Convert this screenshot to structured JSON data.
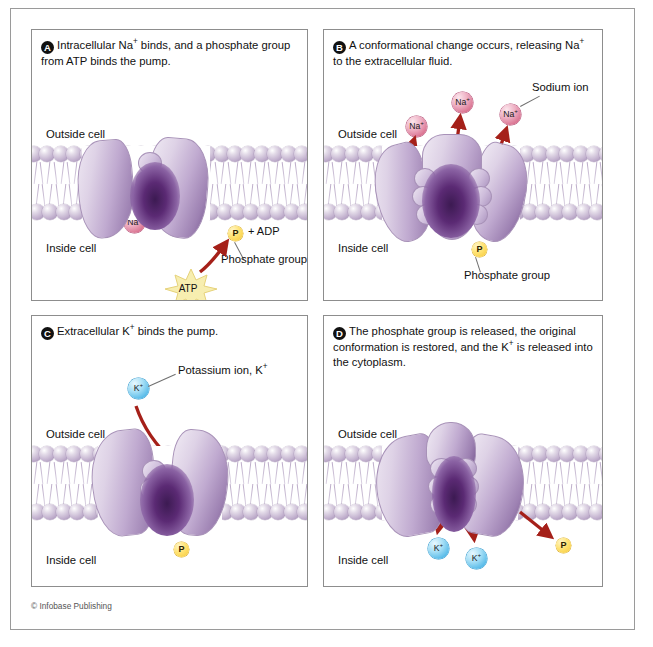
{
  "figure": {
    "credit": "© Infobase Publishing",
    "colors": {
      "sodium_ion": "#d9718f",
      "potassium_ion": "#54b9e8",
      "phosphate": "#ffe271",
      "membrane_head": "#c3b2cf",
      "pump_protein": "#c0aad0",
      "arrow": "#a52019",
      "atp_burst": "#f2e08a"
    }
  },
  "panels": [
    {
      "id": "A",
      "letter": "A",
      "caption_html": "Intracellular Na<sup>+</sup> binds, and a phosphate group from ATP binds the pump.",
      "outside_label": "Outside cell",
      "inside_label": "Inside cell",
      "ions": [
        {
          "type": "sodium",
          "label_html": "Na<sup>+</sup>"
        },
        {
          "type": "sodium",
          "label_html": "Na<sup>+</sup>"
        },
        {
          "type": "sodium",
          "label_html": "Na<sup>+</sup>"
        }
      ],
      "phosphate_label": "P",
      "adp_text": "+ ADP",
      "phosphate_annotation": "Phosphate group",
      "atp_label": "ATP"
    },
    {
      "id": "B",
      "letter": "B",
      "caption_html": "A conformational change occurs, releasing Na<sup>+</sup> to the extracellular fluid.",
      "outside_label": "Outside cell",
      "inside_label": "Inside cell",
      "ions": [
        {
          "type": "sodium",
          "label_html": "Na<sup>+</sup>"
        },
        {
          "type": "sodium",
          "label_html": "Na<sup>+</sup>"
        },
        {
          "type": "sodium",
          "label_html": "Na<sup>+</sup>"
        }
      ],
      "ion_annotation": "Sodium ion",
      "phosphate_label": "P",
      "phosphate_annotation": "Phosphate group"
    },
    {
      "id": "C",
      "letter": "C",
      "caption_html": "Extracellular K<sup>+</sup> binds the pump.",
      "outside_label": "Outside cell",
      "inside_label": "Inside cell",
      "ions": [
        {
          "type": "potassium",
          "label_html": "K<sup>+</sup>"
        },
        {
          "type": "potassium",
          "label_html": "K<sup>+</sup>"
        }
      ],
      "ion_annotation_html": "Potassium ion, K<sup>+</sup>",
      "phosphate_label": "P"
    },
    {
      "id": "D",
      "letter": "D",
      "caption_html": "The phosphate group is released, the original conformation is restored, and the K<sup>+</sup> is released into the cytoplasm.",
      "outside_label": "Outside cell",
      "inside_label": "Inside cell",
      "ions": [
        {
          "type": "potassium",
          "label_html": "K<sup>+</sup>"
        },
        {
          "type": "potassium",
          "label_html": "K<sup>+</sup>"
        }
      ],
      "phosphate_label": "P"
    }
  ]
}
